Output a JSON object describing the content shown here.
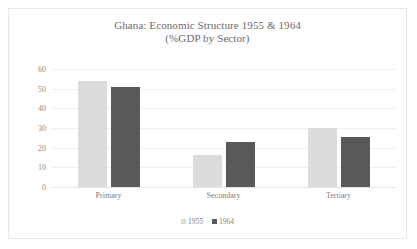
{
  "chart_data": {
    "type": "bar",
    "title": "Ghana: Economic Structure 1955 & 1964",
    "subtitle": "(%GDP by Sector)",
    "xlabel": "",
    "ylabel": "",
    "categories": [
      "Primary",
      "Secondary",
      "Tertiary"
    ],
    "series": [
      {
        "name": "1955",
        "color": "#dcdcdc",
        "values": [
          54,
          16.5,
          30
        ]
      },
      {
        "name": "1964",
        "color": "#595959",
        "values": [
          51,
          23,
          25.5
        ]
      }
    ],
    "ylim": [
      0,
      60
    ],
    "yticks": [
      0,
      10,
      20,
      30,
      40,
      50,
      60
    ],
    "ytick_labels": [
      "0",
      "10",
      "20",
      "30",
      "40",
      "50",
      "60"
    ],
    "grid": true,
    "legend_position": "bottom"
  },
  "frame": {
    "border_color": "#e8e8e8",
    "background": "#ffffff"
  }
}
